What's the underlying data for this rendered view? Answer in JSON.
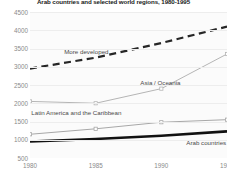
{
  "chart_data": {
    "type": "line",
    "title": "Arab countries and selected world regions, 1980-1995",
    "xlabel": "",
    "ylabel": "",
    "x": [
      1980,
      1985,
      1990,
      1995
    ],
    "xtick_labels": [
      "1980",
      "1985",
      "1990",
      "1995"
    ],
    "ytick_labels": [
      "4500",
      "4000",
      "3500",
      "3000",
      "2500",
      "2000",
      "1500",
      "1000",
      "500"
    ],
    "ylim": [
      500,
      4500
    ],
    "ytick_step": 500,
    "xlim": [
      1980,
      1995
    ],
    "grid": true,
    "legend": "inline-labels",
    "series": [
      {
        "name": "More developed",
        "label": "More developed",
        "values": [
          2950,
          3250,
          3650,
          4100
        ],
        "color": "#262626",
        "style": "dashed",
        "width": 2.2,
        "markers": false
      },
      {
        "name": "Asia / Oceania",
        "label": "Asia / Oceania",
        "values": [
          2050,
          2000,
          2400,
          3350
        ],
        "color": "#b5b5b5",
        "style": "solid",
        "width": 1.0,
        "markers": true
      },
      {
        "name": "Latin America and the Caribbean",
        "label": "Latin America and the Caribbean",
        "values": [
          1150,
          1300,
          1480,
          1550
        ],
        "color": "#a8a8a8",
        "style": "solid",
        "width": 1.0,
        "markers": true
      },
      {
        "name": "Arab countries",
        "label": "Arab countries",
        "values": [
          950,
          1020,
          1110,
          1230
        ],
        "color": "#111111",
        "style": "solid",
        "width": 2.6,
        "markers": false
      }
    ],
    "annotations": [
      {
        "text": "More developed",
        "x": 1982.6,
        "y": 3400
      },
      {
        "text": "Asia / Oceania",
        "x": 1988.4,
        "y": 2560
      },
      {
        "text": "Latin America and the Caribbean",
        "x": 1980.1,
        "y": 1720
      },
      {
        "text": "Arab countries",
        "x": 1991.9,
        "y": 900
      }
    ],
    "colors": {
      "grid": "#ededed",
      "plot_background": "#fbfbfb",
      "tick_text": "#8a8a8a",
      "title_text": "#1a1a1a",
      "label_text": "#4a4a4a"
    }
  }
}
